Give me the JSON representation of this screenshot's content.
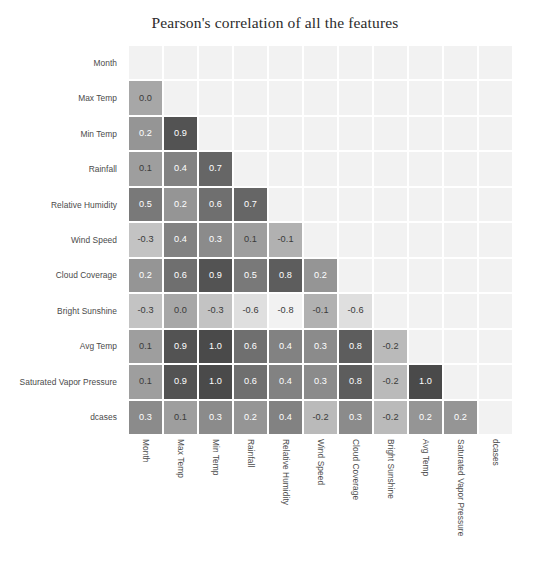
{
  "chart_data": {
    "type": "heatmap",
    "title": "Pearson's correlation of all the features",
    "xlabel": "",
    "ylabel": "",
    "grid": false,
    "legend": "none",
    "annotated": true,
    "annotation_precision": 1,
    "mask": "upper-triangle-including-diagonal",
    "colormap": "grayscale (light = low, dark = high magnitude)",
    "value_range": [
      -0.8,
      1.0
    ],
    "categories": [
      "Month",
      "Max Temp",
      "Min Temp",
      "Rainfall",
      "Relative Humidity",
      "Wind Speed",
      "Cloud Coverage",
      "Bright Sunshine",
      "Avg Temp",
      "Saturated Vapor Pressure",
      "dcases"
    ],
    "x_tick_labels": [
      "Month",
      "Max Temp",
      "Min Temp",
      "Rainfall",
      "Relative Humidity",
      "Wind Speed",
      "Cloud Coverage",
      "Bright Sunshine",
      "Avg Temp",
      "Saturated Vapor Pressure",
      "dcases"
    ],
    "y_tick_labels": [
      "Month",
      "Max Temp",
      "Min Temp",
      "Rainfall",
      "Relative Humidity",
      "Wind Speed",
      "Cloud Coverage",
      "Bright Sunshine",
      "Avg Temp",
      "Saturated Vapor Pressure",
      "dcases"
    ],
    "matrix": [
      [
        null,
        null,
        null,
        null,
        null,
        null,
        null,
        null,
        null,
        null,
        null
      ],
      [
        0.0,
        null,
        null,
        null,
        null,
        null,
        null,
        null,
        null,
        null,
        null
      ],
      [
        0.2,
        0.9,
        null,
        null,
        null,
        null,
        null,
        null,
        null,
        null,
        null
      ],
      [
        0.1,
        0.4,
        0.7,
        null,
        null,
        null,
        null,
        null,
        null,
        null,
        null
      ],
      [
        0.5,
        0.2,
        0.6,
        0.7,
        null,
        null,
        null,
        null,
        null,
        null,
        null
      ],
      [
        -0.3,
        0.4,
        0.3,
        0.1,
        -0.1,
        null,
        null,
        null,
        null,
        null,
        null
      ],
      [
        0.2,
        0.6,
        0.9,
        0.5,
        0.8,
        0.2,
        null,
        null,
        null,
        null,
        null
      ],
      [
        -0.3,
        0.0,
        -0.3,
        -0.6,
        -0.8,
        -0.1,
        -0.6,
        null,
        null,
        null,
        null
      ],
      [
        0.1,
        0.9,
        1.0,
        0.6,
        0.4,
        0.3,
        0.8,
        -0.2,
        null,
        null,
        null
      ],
      [
        0.1,
        0.9,
        1.0,
        0.6,
        0.4,
        0.3,
        0.8,
        -0.2,
        1.0,
        null,
        null
      ],
      [
        0.3,
        0.1,
        0.3,
        0.2,
        0.4,
        -0.2,
        0.3,
        -0.2,
        0.2,
        0.2,
        null
      ]
    ],
    "colors": {
      "figure_background": "#ffffff",
      "masked_cell": "#f2f2f2",
      "cell_border": "#ffffff",
      "title_text": "#2b2b2b",
      "tick_text": "#4a4a4a"
    }
  }
}
